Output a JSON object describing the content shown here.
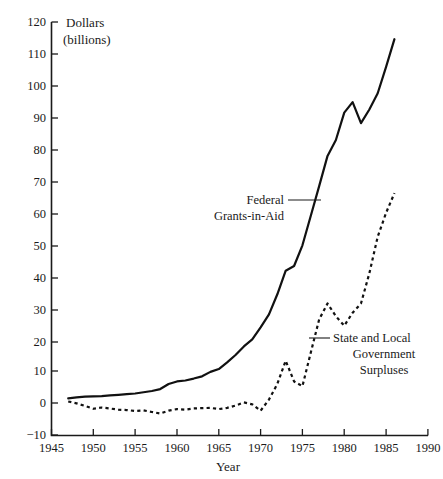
{
  "chart_data": {
    "type": "line",
    "title": "",
    "xlabel": "Year",
    "ylabel": "Dollars (billions)",
    "ylabel_line1": "Dollars",
    "ylabel_line2": "(billions)",
    "xlim": [
      1945,
      1990
    ],
    "ylim": [
      -10,
      120
    ],
    "grid": false,
    "legend_position": "inline-annotations",
    "xticks": [
      1945,
      1950,
      1955,
      1960,
      1965,
      1970,
      1975,
      1980,
      1985,
      1990
    ],
    "xtick_labels": [
      "1945",
      "1950",
      "1955",
      "1960",
      "1965",
      "1970",
      "1975",
      "1980",
      "1985",
      "1990"
    ],
    "yticks": [
      -10,
      0,
      10,
      20,
      30,
      40,
      50,
      60,
      70,
      80,
      90,
      100,
      110,
      120
    ],
    "ytick_labels": [
      "−10",
      "0",
      "10",
      "20",
      "30",
      "40",
      "50",
      "60",
      "70",
      "80",
      "90",
      "100",
      "110",
      "120"
    ],
    "series": [
      {
        "name": "Federal Grants-in-Aid",
        "style": "solid",
        "color": "#111111",
        "annotation_lines": [
          "Federal",
          "Grants-in-Aid"
        ],
        "x": [
          1947,
          1948,
          1949,
          1950,
          1951,
          1952,
          1953,
          1954,
          1955,
          1956,
          1957,
          1958,
          1959,
          1960,
          1961,
          1962,
          1963,
          1964,
          1965,
          1966,
          1967,
          1968,
          1969,
          1970,
          1971,
          1972,
          1973,
          1974,
          1975,
          1976,
          1977,
          1978,
          1979,
          1980,
          1981,
          1982,
          1983,
          1984,
          1985,
          1986
        ],
        "y": [
          1.7,
          2.0,
          2.2,
          2.3,
          2.4,
          2.6,
          2.8,
          3.0,
          3.2,
          3.6,
          4.0,
          4.6,
          6.2,
          7.0,
          7.3,
          7.9,
          8.6,
          10.0,
          10.9,
          13.0,
          15.3,
          18.0,
          20.2,
          24.0,
          28.1,
          34.4,
          41.8,
          43.3,
          49.8,
          59.1,
          68.4,
          77.9,
          82.9,
          91.5,
          94.8,
          88.2,
          92.5,
          97.6,
          105.9,
          114.6
        ]
      },
      {
        "name": "State and Local Government Surpluses",
        "style": "dashed",
        "color": "#111111",
        "annotation_lines": [
          "State and Local",
          "Government",
          "Surpluses"
        ],
        "x": [
          1947,
          1948,
          1949,
          1950,
          1951,
          1952,
          1953,
          1954,
          1955,
          1956,
          1957,
          1958,
          1959,
          1960,
          1961,
          1962,
          1963,
          1964,
          1965,
          1966,
          1967,
          1968,
          1969,
          1970,
          1971,
          1972,
          1973,
          1974,
          1975,
          1976,
          1977,
          1978,
          1979,
          1980,
          1981,
          1982,
          1983,
          1984,
          1985,
          1986
        ],
        "y": [
          0.7,
          0.1,
          -0.7,
          -1.6,
          -1.2,
          -1.5,
          -1.9,
          -2.0,
          -2.3,
          -2.1,
          -2.6,
          -3.1,
          -2.2,
          -1.7,
          -1.9,
          -1.5,
          -1.4,
          -1.3,
          -1.7,
          -1.3,
          -0.6,
          0.4,
          -0.2,
          -2.2,
          1.3,
          6.2,
          13.5,
          7.0,
          5.5,
          16.1,
          26.5,
          31.5,
          27.5,
          24.5,
          28.6,
          31.5,
          41.0,
          52.5,
          60.0,
          66.2
        ]
      }
    ],
    "annotations": [
      {
        "text": "Federal Grants-in-Aid",
        "leader": true
      },
      {
        "text": "State and Local Government Surpluses",
        "leader": true
      }
    ]
  }
}
